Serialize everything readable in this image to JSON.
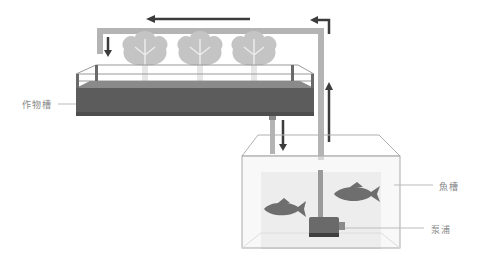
{
  "diagram": {
    "labels": {
      "crop_tank": "作物槽",
      "fish_tank": "魚槽",
      "pump": "泵浦"
    },
    "colors": {
      "pipe": "#b4b4b4",
      "arrow": "#3c3c3c",
      "soil_dark": "#5a5a5a",
      "soil_top": "#8a8a8a",
      "lettuce": "#c8c8c8",
      "fish": "#6e6e6e",
      "water": "#ededed",
      "tank_edge": "#aaaaaa"
    },
    "flow": [
      "fish-tank",
      "pump",
      "riser-pipe",
      "top-pipe",
      "crop-tank",
      "drain-pipe",
      "fish-tank"
    ]
  }
}
